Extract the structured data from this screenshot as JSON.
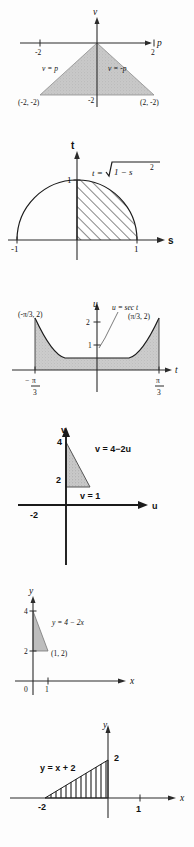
{
  "document": {
    "title": "Six calculus region diagrams",
    "panel_count": 6,
    "background_color": "#fdfdfd",
    "ink_color": "#1a1a1a",
    "shade_fill": "#c9c9c9",
    "hatch_color": "#1b1b1b"
  },
  "panels": [
    {
      "id": "panel-1-triangle-pv",
      "index": "1",
      "axes": {
        "x_label": "p",
        "y_label": "v"
      },
      "tick_labels": {
        "x_neg": "-2",
        "x_pos": "2",
        "y_neg": "-2"
      },
      "curve_labels": {
        "left": "v = p",
        "right": "v = -p"
      },
      "point_labels": {
        "left": "(-2, -2)",
        "right": "(2, -2)"
      },
      "region": {
        "style": "solid-gray",
        "vertices": "(-2,-2), (0,0), (2,-2)"
      }
    },
    {
      "id": "panel-2-semicircle-st",
      "index": "2",
      "axes": {
        "x_label": "s",
        "y_label": "t"
      },
      "tick_labels": {
        "x_neg": "-1",
        "x_pos": "1",
        "y_pos": "1"
      },
      "curve_label": "t = √1 − s²",
      "curve_label_parts": {
        "lhs": "t =",
        "radicand": "1 − s",
        "exponent": "2"
      },
      "region": {
        "style": "diagonal-hatch",
        "description": "quarter disc from s = 0 to s = 1 under t = √(1 − s²)"
      }
    },
    {
      "id": "panel-3-secant-tu",
      "index": "3",
      "axes": {
        "x_label": "t",
        "y_label": "u"
      },
      "curve_label": "u = sec t",
      "tick_labels": {
        "y_pos": "2",
        "y_mid": "1",
        "x_neg": "-π/3",
        "x_pos": "π/3"
      },
      "tick_fractions": {
        "x_neg_num": "π",
        "x_neg_den": "3",
        "x_neg_sign": "−",
        "x_pos_num": "π",
        "x_pos_den": "3"
      },
      "point_labels": {
        "left": "(-π/3, 2)",
        "right": "(π/3, 2)"
      },
      "region": {
        "style": "stippled-gray",
        "description": "area under u = sec t between t = -π/3 and t = π/3"
      }
    },
    {
      "id": "panel-4-triangle-uv",
      "index": "4",
      "axes": {
        "x_label": "u",
        "y_label": "v"
      },
      "tick_labels": {
        "y_top": "4",
        "y_mid": "2",
        "x_neg": "-2"
      },
      "curve_labels": {
        "hypotenuse": "v = 4−2u",
        "base": "v = 1"
      },
      "region": {
        "style": "stippled-gray",
        "description": "triangle bounded by v = 4 − 2u, v = 1 and the v-axis"
      }
    },
    {
      "id": "panel-5-line-xy",
      "index": "5",
      "axes": {
        "x_label": "x",
        "y_label": "y"
      },
      "tick_labels": {
        "y_top": "4",
        "y_mid": "2",
        "origin": "0",
        "x_pos": "1"
      },
      "curve_label": "y = 4 − 2x",
      "point_labels": {
        "corner": "(1, 2)"
      },
      "region": {
        "style": "solid-gray",
        "description": "triangle with vertices (0,2), (0,4), (1,2)"
      }
    },
    {
      "id": "panel-6-line-xy",
      "index": "6",
      "axes": {
        "x_label": "x",
        "y_label": "y"
      },
      "tick_labels": {
        "x_neg": "-2",
        "x_pos": "1",
        "y_pos": "2"
      },
      "curve_label": "y = x + 2",
      "region": {
        "style": "vertical-hatch",
        "description": "triangle with vertices (-2,0), (0,0), (0,2) under y = x + 2"
      }
    }
  ]
}
